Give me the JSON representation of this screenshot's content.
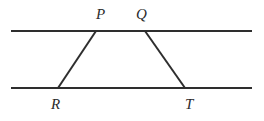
{
  "figure": {
    "background_color": "#ffffff",
    "stroke_color": "#2e2e2e",
    "stroke_width": 2,
    "label_color": "#2b2b2b",
    "canvas": {
      "width": 264,
      "height": 121
    },
    "parallel_lines": [
      {
        "name": "top-parallel-line",
        "x1": 11,
        "y1": 31,
        "x2": 252,
        "y2": 31
      },
      {
        "name": "bottom-parallel-line",
        "x1": 11,
        "y1": 88,
        "x2": 252,
        "y2": 88
      }
    ],
    "transversals": [
      {
        "name": "segment-PR",
        "from": "P",
        "to": "R",
        "x1": 96,
        "y1": 31,
        "x2": 58,
        "y2": 88
      },
      {
        "name": "segment-QT",
        "from": "Q",
        "to": "T",
        "x1": 145,
        "y1": 31,
        "x2": 185,
        "y2": 88
      }
    ],
    "labels": [
      {
        "name": "label-P",
        "text": "P",
        "x": 96,
        "y": 7
      },
      {
        "name": "label-Q",
        "text": "Q",
        "x": 136,
        "y": 7
      },
      {
        "name": "label-R",
        "text": "R",
        "x": 51,
        "y": 97
      },
      {
        "name": "label-T",
        "text": "T",
        "x": 185,
        "y": 97
      }
    ]
  }
}
